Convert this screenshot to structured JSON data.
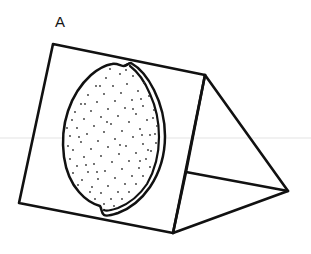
{
  "figure": {
    "panel_label": "A",
    "caption": "",
    "background_color": "#ffffff",
    "ink_color": "#111111",
    "width": 311,
    "height": 254
  },
  "objects": {
    "prism": {
      "name": "triangular-prism",
      "description": "Tent-shaped triangular prism drawn in line art",
      "stroke_color": "#111111",
      "stroke_width": 2.6,
      "fill": "none",
      "vertices": {
        "front_top_left": [
          53,
          44
        ],
        "front_top_right": [
          205,
          75
        ],
        "front_bottom_right": [
          173,
          233
        ],
        "front_bottom_left": [
          19,
          203
        ],
        "apex_right": [
          205,
          75
        ],
        "right_far": [
          288,
          191
        ],
        "base_mid": [
          186,
          172
        ]
      },
      "edges": [
        {
          "name": "front-face-top-edge",
          "from": [
            53,
            44
          ],
          "to": [
            205,
            75
          ]
        },
        {
          "name": "front-face-left-edge",
          "from": [
            53,
            44
          ],
          "to": [
            19,
            203
          ]
        },
        {
          "name": "front-face-bottom-edge",
          "from": [
            19,
            203
          ],
          "to": [
            173,
            233
          ]
        },
        {
          "name": "ridge-edge",
          "from": [
            205,
            75
          ],
          "to": [
            173,
            233
          ]
        },
        {
          "name": "back-face-top-edge",
          "from": [
            205,
            75
          ],
          "to": [
            288,
            191
          ]
        },
        {
          "name": "base-far-edge",
          "from": [
            173,
            233
          ],
          "to": [
            288,
            191
          ]
        },
        {
          "name": "base-inner-edge",
          "from": [
            186,
            172
          ],
          "to": [
            288,
            191
          ]
        },
        {
          "name": "ridge-lower-segment",
          "from": [
            186,
            172
          ],
          "to": [
            173,
            233
          ]
        }
      ]
    },
    "lemon": {
      "name": "stippled-lemon",
      "description": "Lemon-shaped oval with pointed top and bottom nubs, stippled interior, double rind line on the right",
      "outer_outline_color": "#111111",
      "inner_outline_color": "#111111",
      "stroke_width": 2.4,
      "fill": "#ffffff",
      "stipple_dot_color": "#333333",
      "stipple_dot_radius": 0.9,
      "stipple_dot_count": 104,
      "center": [
        110,
        139
      ],
      "bounds": [
        63,
        62,
        166,
        217
      ]
    }
  },
  "artifacts": {
    "scan_line": {
      "name": "faint-horizontal-scan-line",
      "y": 138,
      "color": "#f0f0f0",
      "visible": true
    }
  }
}
